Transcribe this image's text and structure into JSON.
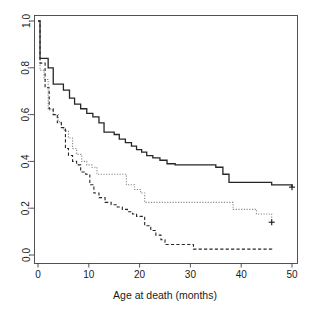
{
  "chart_data": {
    "type": "line",
    "plot_style": "kaplan-meier-step",
    "title": "",
    "subtitle": "",
    "xlabel": "Age at death (months)",
    "ylabel": "",
    "xlim": [
      0,
      50
    ],
    "ylim": [
      0.0,
      1.0
    ],
    "xticks": [
      0,
      10,
      20,
      30,
      40,
      50
    ],
    "xtick_labels": [
      "0",
      "10",
      "20",
      "30",
      "40",
      "50"
    ],
    "yticks": [
      0.0,
      0.2,
      0.4,
      0.6,
      0.8,
      1.0
    ],
    "ytick_labels": [
      "0.0",
      "0.2",
      "0.4",
      "0.6",
      "0.8",
      "1.0"
    ],
    "ytick_labels_rotated": true,
    "grid": false,
    "legend": "none",
    "box": true,
    "annotations": [],
    "series": [
      {
        "name": "solid-curve",
        "style": "solid",
        "color": "#262626",
        "width": 1.3,
        "censor_marks": [
          {
            "x": 50,
            "y": 0.29
          }
        ],
        "x": [
          0,
          0.4,
          1.0,
          2.0,
          3.0,
          4.0,
          5.0,
          6.2,
          7.2,
          8.4,
          9.6,
          10.8,
          12.0,
          13.0,
          13.8,
          15.0,
          16.0,
          17.2,
          18.4,
          19.4,
          20.4,
          21.4,
          22.6,
          24.0,
          25.4,
          27.0,
          29.0,
          31.0,
          33.0,
          35.0,
          36.4,
          37.6,
          41.0,
          46.0,
          50.0
        ],
        "y": [
          1.0,
          0.84,
          0.84,
          0.8,
          0.73,
          0.73,
          0.705,
          0.67,
          0.645,
          0.625,
          0.605,
          0.59,
          0.565,
          0.525,
          0.525,
          0.515,
          0.495,
          0.48,
          0.465,
          0.45,
          0.44,
          0.425,
          0.415,
          0.405,
          0.39,
          0.385,
          0.385,
          0.385,
          0.385,
          0.375,
          0.345,
          0.31,
          0.31,
          0.3,
          0.29
        ]
      },
      {
        "name": "dotted-gray-curve",
        "style": "dotted",
        "color": "#8c8c8c",
        "width": 1.1,
        "censor_marks": [
          {
            "x": 46,
            "y": 0.14
          }
        ],
        "x": [
          0,
          0.4,
          1.2,
          2.0,
          3.0,
          4.0,
          4.6,
          5.2,
          6.0,
          6.8,
          7.6,
          8.6,
          9.6,
          10.6,
          11.6,
          13.0,
          15.0,
          16.6,
          17.4,
          19.0,
          20.2,
          21.0,
          25.0,
          30.0,
          34.0,
          37.4,
          38.4,
          41.0,
          43.0,
          46.0
        ],
        "y": [
          1.0,
          0.79,
          0.75,
          0.62,
          0.6,
          0.57,
          0.54,
          0.53,
          0.5,
          0.455,
          0.43,
          0.4,
          0.385,
          0.375,
          0.345,
          0.345,
          0.345,
          0.345,
          0.3,
          0.28,
          0.265,
          0.225,
          0.225,
          0.225,
          0.225,
          0.225,
          0.195,
          0.195,
          0.175,
          0.14
        ]
      },
      {
        "name": "dashed-curve",
        "style": "dashed",
        "color": "#262626",
        "width": 1.1,
        "censor_marks": [],
        "x": [
          0,
          0.4,
          1.4,
          2.2,
          3.0,
          3.8,
          4.6,
          5.4,
          6.0,
          6.8,
          7.6,
          8.4,
          9.4,
          10.2,
          11.0,
          12.0,
          13.2,
          14.4,
          15.6,
          16.6,
          17.6,
          18.6,
          19.4,
          20.0,
          21.0,
          22.2,
          23.2,
          24.2,
          25.0,
          30.0,
          30.6,
          38.0,
          46.0
        ],
        "y": [
          1.0,
          0.82,
          0.715,
          0.625,
          0.6,
          0.565,
          0.545,
          0.455,
          0.425,
          0.4,
          0.385,
          0.355,
          0.345,
          0.3,
          0.265,
          0.245,
          0.225,
          0.215,
          0.205,
          0.195,
          0.185,
          0.175,
          0.165,
          0.165,
          0.125,
          0.105,
          0.085,
          0.065,
          0.045,
          0.045,
          0.025,
          0.025,
          0.022
        ]
      }
    ]
  }
}
